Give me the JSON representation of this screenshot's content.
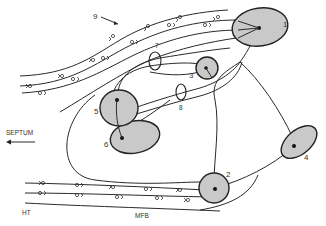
{
  "diagram": {
    "labels": {
      "tract_9": "9",
      "nucleus_1": "1",
      "nucleus_2": "2",
      "nucleus_3": "3",
      "nucleus_4": "4",
      "nucleus_5": "5",
      "nucleus_6": "6",
      "ring_7": "7",
      "ring_8": "8",
      "septum": "SEPTUM",
      "ht": "HT",
      "mfb": "MFB"
    },
    "nuclei": [
      {
        "id": "1",
        "cx": 260,
        "cy": 27,
        "rx": 28,
        "ry": 19
      },
      {
        "id": "2",
        "cx": 214,
        "cy": 188,
        "rx": 15,
        "ry": 15
      },
      {
        "id": "3",
        "cx": 207,
        "cy": 68,
        "rx": 11,
        "ry": 11
      },
      {
        "id": "4",
        "cx": 299,
        "cy": 142,
        "rx": 20,
        "ry": 12
      },
      {
        "id": "5",
        "cx": 120,
        "cy": 110,
        "rx": 20,
        "ry": 18
      },
      {
        "id": "6",
        "cx": 133,
        "cy": 137,
        "rx": 24,
        "ry": 16
      }
    ],
    "rings": [
      {
        "id": "7",
        "cx": 155,
        "cy": 61,
        "rx": 6,
        "ry": 9
      },
      {
        "id": "8",
        "cx": 181,
        "cy": 92,
        "rx": 5,
        "ry": 8
      }
    ],
    "fill_color": "#c9c9c9",
    "stroke_color": "#222222"
  }
}
